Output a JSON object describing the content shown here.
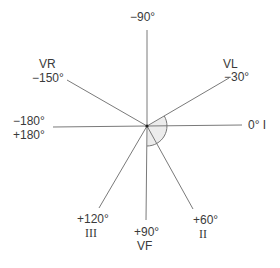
{
  "diagram": {
    "center": {
      "x": 147,
      "y": 126
    },
    "colors": {
      "line": "#7a7a7a",
      "arc": "#777777",
      "sector_fill": "#ececec",
      "text": "#3a3a3a"
    },
    "axes": [
      {
        "angle": 0,
        "lead": "I",
        "angle_label": "0°",
        "end": [
          242,
          125
        ]
      },
      {
        "angle": -30,
        "lead": "VL",
        "angle_label": "−30°",
        "end": [
          229,
          78
        ]
      },
      {
        "angle": -90,
        "lead": "",
        "angle_label": "−90°",
        "end": [
          147,
          30
        ]
      },
      {
        "angle": -150,
        "lead": "VR",
        "angle_label": "−150°",
        "end": [
          67,
          80
        ]
      },
      {
        "angle": 180,
        "lead": "",
        "angle_label": "−180° / +180°",
        "end": [
          53,
          127
        ]
      },
      {
        "angle": 120,
        "lead": "III",
        "angle_label": "+120°",
        "end": [
          99,
          208
        ]
      },
      {
        "angle": 90,
        "lead": "VF",
        "angle_label": "+90°",
        "end": [
          146,
          220
        ]
      },
      {
        "angle": 60,
        "lead": "II",
        "angle_label": "+60°",
        "end": [
          193,
          209
        ]
      }
    ],
    "normal_range_arc": {
      "from_deg": -30,
      "to_deg": 90,
      "radius": 20
    },
    "labels": {
      "minus90": "−90°",
      "vl_lead": "VL",
      "vl_angle": "−30°",
      "vr_lead": "VR",
      "vr_angle": "−150°",
      "zero": "0°  I",
      "minus180": "−180°",
      "plus180": "+180°",
      "plus120": "+120°",
      "lead_iii": "III",
      "plus90": "+90°",
      "lead_vf": "VF",
      "plus60": "+60°",
      "lead_ii": "II"
    }
  }
}
